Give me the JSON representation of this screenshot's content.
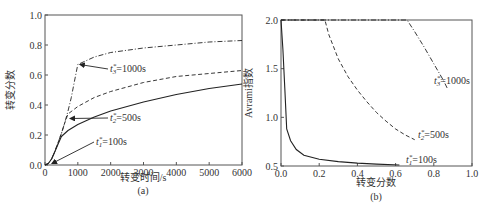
{
  "chart_data": [
    {
      "id": "a",
      "type": "line",
      "panel_label": "(a)",
      "title": "",
      "xlabel": "转变时间/s",
      "ylabel": "转变分数",
      "xlim": [
        0,
        6000
      ],
      "ylim": [
        0.0,
        1.0
      ],
      "xticks": [
        "0",
        "1000",
        "2000",
        "3000",
        "4000",
        "5000",
        "6000"
      ],
      "yticks": [
        "0.0",
        "0.2",
        "0.4",
        "0.6",
        "0.8",
        "1.0"
      ],
      "grid": false,
      "series": [
        {
          "name": "t1*=100s",
          "style": "solid",
          "x": [
            0,
            100,
            200,
            300,
            400,
            500,
            700,
            1000,
            1500,
            2000,
            3000,
            4000,
            5000,
            6000
          ],
          "y": [
            0.0,
            0.01,
            0.04,
            0.09,
            0.14,
            0.19,
            0.23,
            0.27,
            0.32,
            0.36,
            0.42,
            0.47,
            0.51,
            0.54
          ]
        },
        {
          "name": "t2*=500s",
          "style": "dashed",
          "x": [
            0,
            100,
            200,
            300,
            400,
            500,
            600,
            700,
            1000,
            1500,
            2000,
            3000,
            4000,
            5000,
            6000
          ],
          "y": [
            0.0,
            0.01,
            0.04,
            0.09,
            0.15,
            0.21,
            0.28,
            0.34,
            0.39,
            0.45,
            0.49,
            0.55,
            0.59,
            0.61,
            0.63
          ]
        },
        {
          "name": "t3*=1000s",
          "style": "dashdot",
          "x": [
            0,
            100,
            200,
            300,
            400,
            500,
            600,
            700,
            800,
            900,
            1000,
            1500,
            2000,
            3000,
            4000,
            5000,
            6000
          ],
          "y": [
            0.0,
            0.01,
            0.04,
            0.09,
            0.15,
            0.21,
            0.28,
            0.36,
            0.45,
            0.56,
            0.67,
            0.72,
            0.75,
            0.78,
            0.8,
            0.82,
            0.83
          ]
        }
      ],
      "annotations": [
        {
          "text_base": "t",
          "sub": "3",
          "sup": "*",
          "rest": "=1000s",
          "points_to": [
            1000,
            0.67
          ]
        },
        {
          "text_base": "t",
          "sub": "2",
          "sup": "*",
          "rest": "=500s",
          "points_to": [
            700,
            0.31
          ]
        },
        {
          "text_base": "t",
          "sub": "1",
          "sup": "*",
          "rest": "=100s",
          "points_to": [
            150,
            0.01
          ]
        }
      ]
    },
    {
      "id": "b",
      "type": "line",
      "panel_label": "(b)",
      "title": "",
      "xlabel": "转变分数",
      "ylabel": "Avrami指数",
      "xlim": [
        0.0,
        1.0
      ],
      "ylim": [
        0.5,
        2.0
      ],
      "xticks": [
        "0.0",
        "0.2",
        "0.4",
        "0.6",
        "0.8",
        "1.0"
      ],
      "yticks": [
        "0.5",
        "1.0",
        "1.5",
        "2.0"
      ],
      "grid": false,
      "series": [
        {
          "name": "t1*=100s",
          "style": "solid",
          "x": [
            0.0,
            0.01,
            0.02,
            0.03,
            0.05,
            0.08,
            0.12,
            0.2,
            0.3,
            0.4,
            0.5,
            0.62
          ],
          "y": [
            2.0,
            1.7,
            1.3,
            0.88,
            0.76,
            0.67,
            0.61,
            0.57,
            0.545,
            0.53,
            0.52,
            0.51
          ]
        },
        {
          "name": "t2*=500s",
          "style": "dashed",
          "x": [
            0.0,
            0.23,
            0.25,
            0.3,
            0.35,
            0.4,
            0.45,
            0.5,
            0.55,
            0.6,
            0.65,
            0.7
          ],
          "y": [
            2.0,
            2.0,
            1.85,
            1.6,
            1.42,
            1.28,
            1.16,
            1.05,
            0.96,
            0.88,
            0.82,
            0.77
          ]
        },
        {
          "name": "t3*=1000s",
          "style": "dashdot",
          "x": [
            0.0,
            0.66,
            0.7,
            0.75,
            0.8,
            0.85,
            0.87
          ],
          "y": [
            2.0,
            2.0,
            1.88,
            1.72,
            1.55,
            1.38,
            1.3
          ]
        }
      ],
      "annotations": [
        {
          "text_base": "t",
          "sub": "3",
          "sup": "*",
          "rest": "=1000s",
          "at": [
            0.86,
            1.25
          ]
        },
        {
          "text_base": "t",
          "sub": "2",
          "sup": "*",
          "rest": "=500s",
          "at": [
            0.7,
            0.73
          ]
        },
        {
          "text_base": "t",
          "sub": "1",
          "sup": "*",
          "rest": "=100s",
          "at": [
            0.64,
            0.53
          ]
        }
      ]
    }
  ]
}
